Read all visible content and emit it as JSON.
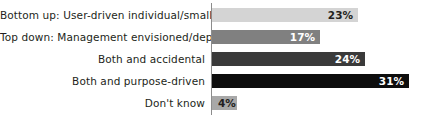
{
  "chart_data": {
    "type": "bar",
    "orientation": "horizontal",
    "title": "",
    "subtitle": "",
    "xlabel": "",
    "ylabel": "",
    "xlim": [
      0,
      35
    ],
    "grid": false,
    "legend": "none",
    "axis_line": "vertical-category-axis",
    "value_suffix": "%",
    "categories": [
      "Bottom up: User-driven individual/small pilots",
      "Top down: Management envisioned/deployed",
      "Both and accidental",
      "Both and purpose-driven",
      "Don't know"
    ],
    "values": [
      23,
      17,
      24,
      31,
      4
    ],
    "value_labels": [
      "23%",
      "17%",
      "24%",
      "31%",
      "4%"
    ],
    "bar_colors": [
      "#d4d4d4",
      "#808080",
      "#3a3a3a",
      "#0d0d0d",
      "#a8a8a8"
    ],
    "value_label_colors": [
      "#231f20",
      "#ffffff",
      "#ffffff",
      "#ffffff",
      "#231f20"
    ],
    "bars": [
      {
        "label": "Bottom up: User-driven individual/small pilots",
        "value": 23,
        "value_label": "23%",
        "color": "#d4d4d4",
        "text_color": "#231f20",
        "label_placement": "inside"
      },
      {
        "label": "Top down: Management envisioned/deployed",
        "value": 17,
        "value_label": "17%",
        "color": "#808080",
        "text_color": "#ffffff",
        "label_placement": "inside"
      },
      {
        "label": "Both and accidental",
        "value": 24,
        "value_label": "24%",
        "color": "#3a3a3a",
        "text_color": "#ffffff",
        "label_placement": "inside"
      },
      {
        "label": "Both and purpose-driven",
        "value": 31,
        "value_label": "31%",
        "color": "#0d0d0d",
        "text_color": "#ffffff",
        "label_placement": "inside"
      },
      {
        "label": "Don't know",
        "value": 4,
        "value_label": "4%",
        "color": "#a8a8a8",
        "text_color": "#231f20",
        "label_placement": "inside-left"
      }
    ]
  },
  "style": {
    "background": "#ffffff",
    "axis_color": "#8c8c8c",
    "category_text_color": "#231f20"
  }
}
